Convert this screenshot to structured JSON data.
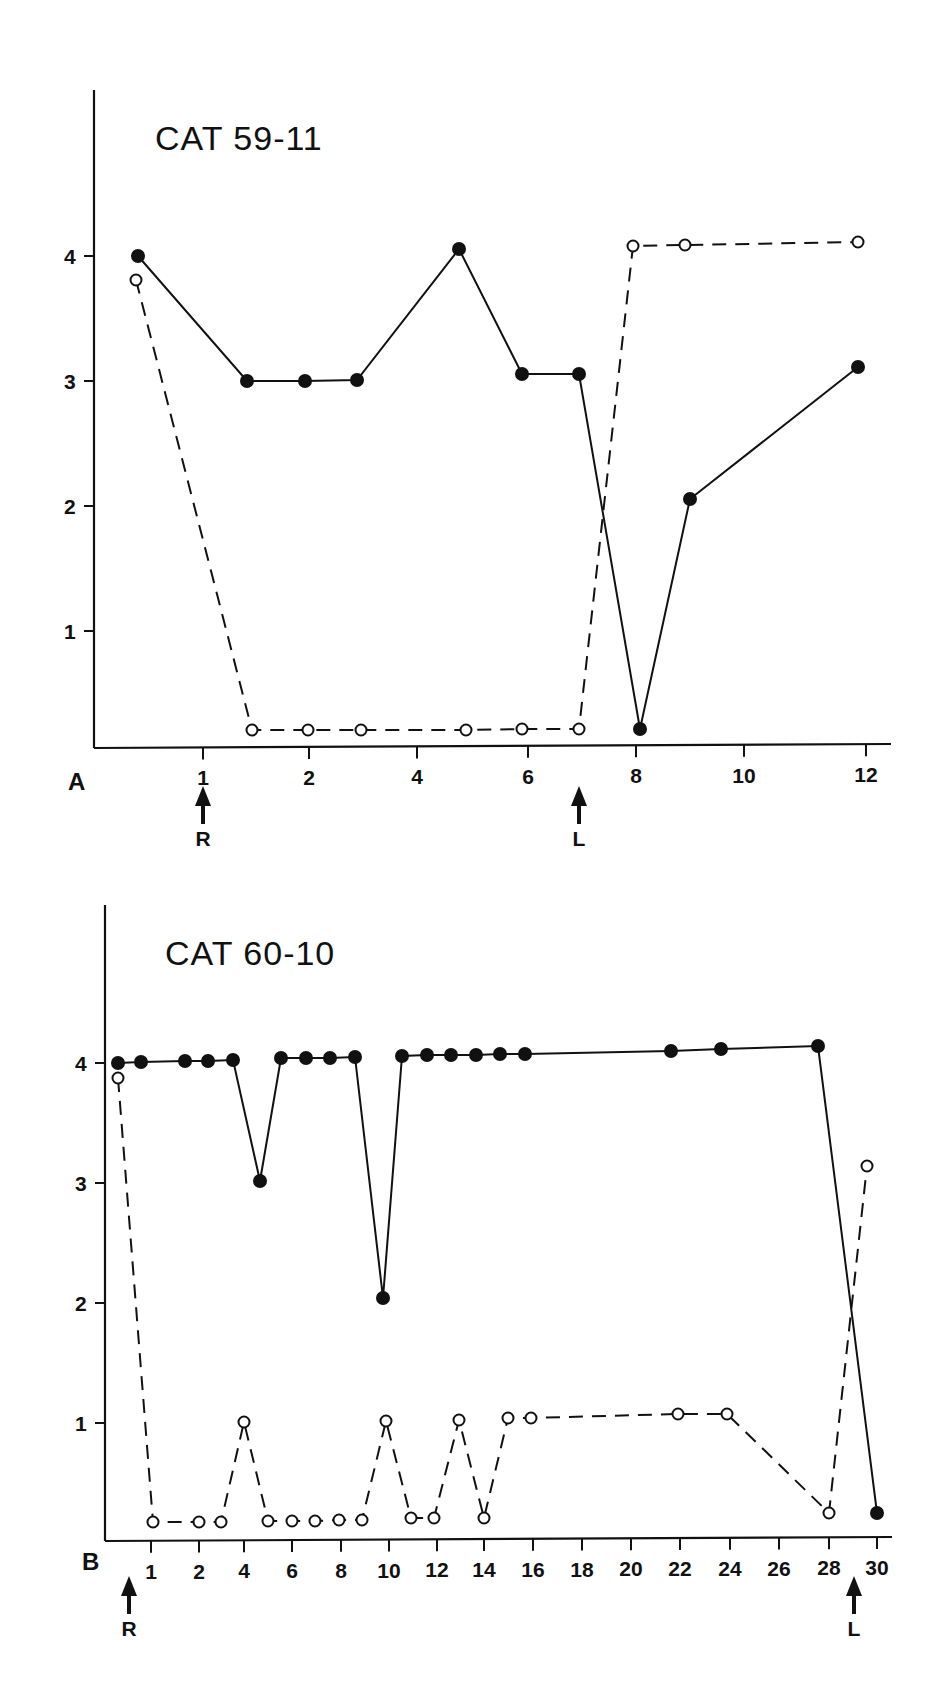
{
  "figure": {
    "panels": [
      {
        "id": "A",
        "label": "A",
        "title": "CAT 59-11"
      },
      {
        "id": "B",
        "label": "B",
        "title": "CAT 60-10"
      }
    ]
  },
  "chart_data": [
    {
      "type": "line",
      "panel": "A",
      "title": "CAT 59-11",
      "xlabel": "",
      "ylabel": "",
      "y_ticks": [
        1,
        2,
        3,
        4
      ],
      "x_ticks": [
        "1",
        "2",
        "4",
        "6",
        "8",
        "10",
        "12"
      ],
      "ylim": [
        0,
        5
      ],
      "grid": false,
      "legend": null,
      "annotations": [
        {
          "label": "R",
          "type": "arrow",
          "x": 1
        },
        {
          "label": "L",
          "type": "arrow",
          "x": 7
        }
      ],
      "series": [
        {
          "name": "filled circles (solid line)",
          "marker": "filled-circle",
          "line": "solid",
          "points": [
            [
              0.6,
              4.0
            ],
            [
              2.1,
              3.0
            ],
            [
              3.0,
              3.0
            ],
            [
              3.9,
              3.0
            ],
            [
              4.8,
              4.05
            ],
            [
              5.9,
              3.05
            ],
            [
              7.0,
              3.05
            ],
            [
              8.0,
              0.15
            ],
            [
              8.9,
              2.05
            ],
            [
              11.8,
              3.1
            ]
          ]
        },
        {
          "name": "open circles (dashed line)",
          "marker": "open-circle",
          "line": "dashed",
          "points": [
            [
              0.6,
              3.8
            ],
            [
              2.1,
              0.15
            ],
            [
              3.0,
              0.15
            ],
            [
              3.9,
              0.15
            ],
            [
              5.0,
              0.15
            ],
            [
              5.9,
              0.15
            ],
            [
              6.95,
              0.15
            ],
            [
              7.9,
              4.08
            ],
            [
              8.9,
              4.08
            ],
            [
              11.8,
              4.12
            ]
          ]
        }
      ]
    },
    {
      "type": "line",
      "panel": "B",
      "title": "CAT 60-10",
      "xlabel": "",
      "ylabel": "",
      "y_ticks": [
        1,
        2,
        3,
        4
      ],
      "x_ticks": [
        "1",
        "2",
        "4",
        "6",
        "8",
        "10",
        "12",
        "14",
        "16",
        "18",
        "20",
        "22",
        "24",
        "26",
        "28",
        "30"
      ],
      "ylim": [
        0,
        5
      ],
      "grid": false,
      "legend": null,
      "annotations": [
        {
          "label": "R",
          "type": "arrow",
          "x": 0.5
        },
        {
          "label": "L",
          "type": "arrow",
          "x": 29
        }
      ],
      "series": [
        {
          "name": "filled circles (solid line)",
          "marker": "filled-circle",
          "line": "solid",
          "points": [
            [
              0.5,
              4.0
            ],
            [
              1,
              4.0
            ],
            [
              2,
              4.02
            ],
            [
              3,
              4.02
            ],
            [
              4,
              4.03
            ],
            [
              4.5,
              3.0
            ],
            [
              5,
              4.03
            ],
            [
              6,
              4.04
            ],
            [
              7,
              4.04
            ],
            [
              8,
              4.05
            ],
            [
              10,
              2.05
            ],
            [
              11,
              4.05
            ],
            [
              12,
              4.06
            ],
            [
              13,
              4.07
            ],
            [
              14,
              4.07
            ],
            [
              15,
              4.08
            ],
            [
              16,
              4.08
            ],
            [
              22,
              4.1
            ],
            [
              24,
              4.12
            ],
            [
              28,
              4.15
            ],
            [
              30,
              0.25
            ]
          ]
        },
        {
          "name": "open circles (dashed line)",
          "marker": "open-circle",
          "line": "dashed",
          "points": [
            [
              0.5,
              3.88
            ],
            [
              1,
              0.15
            ],
            [
              2,
              0.15
            ],
            [
              3,
              0.15
            ],
            [
              4,
              1.0
            ],
            [
              5,
              0.15
            ],
            [
              6,
              0.15
            ],
            [
              7,
              0.15
            ],
            [
              8,
              0.15
            ],
            [
              9,
              0.15
            ],
            [
              10,
              1.0
            ],
            [
              11,
              0.15
            ],
            [
              12,
              0.15
            ],
            [
              13,
              1.0
            ],
            [
              14,
              0.15
            ],
            [
              15,
              1.02
            ],
            [
              16,
              1.02
            ],
            [
              22,
              1.05
            ],
            [
              24,
              1.05
            ],
            [
              28,
              0.25
            ],
            [
              29.5,
              3.1
            ]
          ]
        }
      ]
    }
  ],
  "layout": {
    "A": {
      "axis": {
        "x0": 94,
        "x1": 891,
        "y_axis_top": 90,
        "y0": 748
      },
      "y_px": {
        "4": 256,
        "3": 381,
        "2": 506,
        "1": 631,
        "0": 756
      },
      "x_tick_px": {
        "1": 203,
        "2": 309,
        "4": 417,
        "6": 528,
        "8": 636,
        "10": 744,
        "12": 866
      },
      "title_pos": [
        155,
        150
      ],
      "label_pos": [
        68,
        790
      ],
      "points_px": {
        "filled": [
          [
            138,
            256
          ],
          [
            247,
            381
          ],
          [
            305,
            381
          ],
          [
            357,
            380
          ],
          [
            459,
            249
          ],
          [
            522,
            374
          ],
          [
            579,
            374
          ],
          [
            640,
            729
          ],
          [
            690,
            499
          ],
          [
            858,
            367
          ]
        ],
        "open": [
          [
            136,
            280
          ],
          [
            252,
            730
          ],
          [
            308,
            730
          ],
          [
            361,
            730
          ],
          [
            466,
            730
          ],
          [
            522,
            729
          ],
          [
            579,
            729
          ],
          [
            633,
            246
          ],
          [
            685,
            245
          ],
          [
            858,
            242
          ]
        ]
      },
      "arrows": [
        {
          "x": 203,
          "label_y": 850
        },
        {
          "x": 579,
          "label_y": 850
        }
      ]
    },
    "B": {
      "axis": {
        "x0": 105,
        "x1": 892,
        "y_axis_top": 905,
        "y0": 1541
      },
      "y_px": {
        "4": 1063,
        "3": 1183,
        "2": 1303,
        "1": 1423,
        "0": 1543
      },
      "x_tick_px": {
        "1": 151,
        "2": 199,
        "4": 244,
        "6": 292,
        "8": 341,
        "10": 389,
        "12": 437,
        "14": 484,
        "16": 533,
        "18": 582,
        "20": 631,
        "22": 680,
        "24": 730,
        "26": 779,
        "28": 829,
        "30": 877
      },
      "title_pos": [
        165,
        965
      ],
      "label_pos": [
        82,
        1570
      ],
      "points_px": {
        "filled": [
          [
            118,
            1063
          ],
          [
            141,
            1062
          ],
          [
            185,
            1061
          ],
          [
            208,
            1061
          ],
          [
            233,
            1060
          ],
          [
            260,
            1181
          ],
          [
            281,
            1058
          ],
          [
            306,
            1058
          ],
          [
            330,
            1058
          ],
          [
            355,
            1057
          ],
          [
            383,
            1298
          ],
          [
            402,
            1056
          ],
          [
            427,
            1055
          ],
          [
            451,
            1055
          ],
          [
            476,
            1055
          ],
          [
            500,
            1054
          ],
          [
            525,
            1054
          ],
          [
            671,
            1051
          ],
          [
            721,
            1049
          ],
          [
            818,
            1046
          ],
          [
            877,
            1513
          ]
        ],
        "open": [
          [
            118,
            1078
          ],
          [
            153,
            1522
          ],
          [
            199,
            1522
          ],
          [
            221,
            1522
          ],
          [
            244,
            1422
          ],
          [
            268,
            1521
          ],
          [
            292,
            1521
          ],
          [
            315,
            1521
          ],
          [
            339,
            1520
          ],
          [
            362,
            1520
          ],
          [
            386,
            1421
          ],
          [
            411,
            1518
          ],
          [
            434,
            1518
          ],
          [
            459,
            1420
          ],
          [
            484,
            1518
          ],
          [
            508,
            1418
          ],
          [
            531,
            1418
          ],
          [
            678,
            1414
          ],
          [
            727,
            1414
          ],
          [
            829,
            1513
          ],
          [
            867,
            1166
          ]
        ]
      },
      "arrows": [
        {
          "x": 129,
          "label_y": 1640
        },
        {
          "x": 854,
          "label_y": 1640
        }
      ]
    }
  }
}
